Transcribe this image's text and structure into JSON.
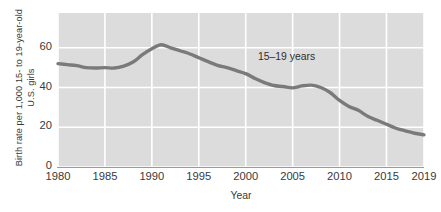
{
  "chart_data": {
    "type": "line",
    "title": "",
    "xlabel": "Year",
    "ylabel": "Birth rate per 1,000 15- to 19-year-old\nU.S. girls",
    "xlim": [
      1980,
      2019
    ],
    "ylim": [
      0,
      77.5
    ],
    "yticks": [
      0,
      20,
      40,
      60
    ],
    "ytick_labels": [
      "0",
      "20",
      "40",
      "60"
    ],
    "xticks": [
      1980,
      1985,
      1990,
      1995,
      2000,
      2005,
      2010,
      2015,
      2019
    ],
    "xtick_labels": [
      "1980",
      "1985",
      "1990",
      "1995",
      "2000",
      "2005",
      "2010",
      "2015",
      "2019"
    ],
    "grid": true,
    "grid_color": "#ffffff",
    "plot_bgcolor": "#dcdcdc",
    "line_color": "#7a7a7a",
    "line_width": 3.4,
    "legend_position": "inline-annotation",
    "annotations": [
      {
        "text": "15–19 years",
        "x": 2000,
        "y": 52
      }
    ],
    "series": [
      {
        "name": "15–19 years",
        "x": [
          1980,
          1981,
          1982,
          1983,
          1984,
          1985,
          1986,
          1987,
          1988,
          1989,
          1990,
          1991,
          1992,
          1993,
          1994,
          1995,
          1996,
          1997,
          1998,
          1999,
          2000,
          2001,
          2002,
          2003,
          2004,
          2005,
          2006,
          2007,
          2008,
          2009,
          2010,
          2011,
          2012,
          2013,
          2014,
          2015,
          2016,
          2017,
          2018,
          2019
        ],
        "values": [
          52.0,
          51.5,
          51.0,
          50.0,
          49.8,
          50.0,
          49.8,
          50.8,
          52.8,
          56.5,
          59.5,
          61.5,
          60.0,
          58.5,
          57.0,
          55.0,
          53.0,
          51.2,
          50.0,
          48.5,
          47.0,
          44.5,
          42.5,
          41.0,
          40.5,
          39.8,
          40.8,
          41.2,
          40.0,
          37.5,
          33.5,
          30.5,
          28.5,
          25.5,
          23.5,
          21.5,
          19.5,
          18.2,
          17.0,
          16.2
        ]
      }
    ]
  }
}
